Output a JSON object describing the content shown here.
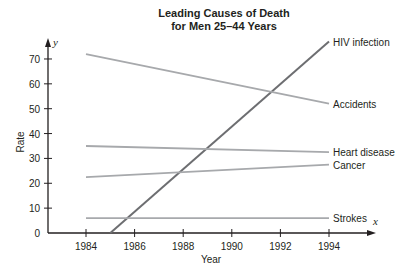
{
  "chart_data": {
    "type": "line",
    "title": "Leading Causes of Death",
    "subtitle": "for Men 25–44 Years",
    "xlabel": "Year",
    "ylabel": "Rate",
    "x_axis_var": "x",
    "y_axis_var": "y",
    "x_ticks": [
      1984,
      1986,
      1988,
      1990,
      1992,
      1994
    ],
    "y_ticks": [
      0,
      10,
      20,
      30,
      40,
      50,
      60,
      70
    ],
    "xlim": [
      1981.6,
      1996
    ],
    "ylim": [
      0,
      78
    ],
    "grid": false,
    "legend": "inline labels at right end of each line",
    "series": [
      {
        "name": "HIV infection",
        "x": [
          1985,
          1994
        ],
        "values": [
          0,
          77
        ],
        "color": "#6d6e71"
      },
      {
        "name": "Accidents",
        "x": [
          1984,
          1994
        ],
        "values": [
          72,
          52
        ],
        "color": "#a7a9ac"
      },
      {
        "name": "Heart disease",
        "x": [
          1984,
          1994
        ],
        "values": [
          35,
          32.5
        ],
        "color": "#a7a9ac"
      },
      {
        "name": "Cancer",
        "x": [
          1984,
          1994
        ],
        "values": [
          22.5,
          27.5
        ],
        "color": "#a7a9ac"
      },
      {
        "name": "Strokes",
        "x": [
          1984,
          1994
        ],
        "values": [
          6,
          6
        ],
        "color": "#a7a9ac"
      }
    ]
  },
  "labels": {
    "title_line1": "Leading Causes of Death",
    "title_line2": "for Men 25–44 Years",
    "xlabel": "Year",
    "ylabel": "Rate",
    "x_var": "x",
    "y_var": "y",
    "x_ticks": [
      "1984",
      "1986",
      "1988",
      "1990",
      "1992",
      "1994"
    ],
    "y_ticks": [
      "0",
      "10",
      "20",
      "30",
      "40",
      "50",
      "60",
      "70"
    ],
    "series": [
      "HIV infection",
      "Accidents",
      "Heart disease",
      "Cancer",
      "Strokes"
    ]
  },
  "colors": {
    "axis": "#231f20",
    "primary_line": "#6d6e71",
    "secondary_line": "#a7a9ac"
  }
}
